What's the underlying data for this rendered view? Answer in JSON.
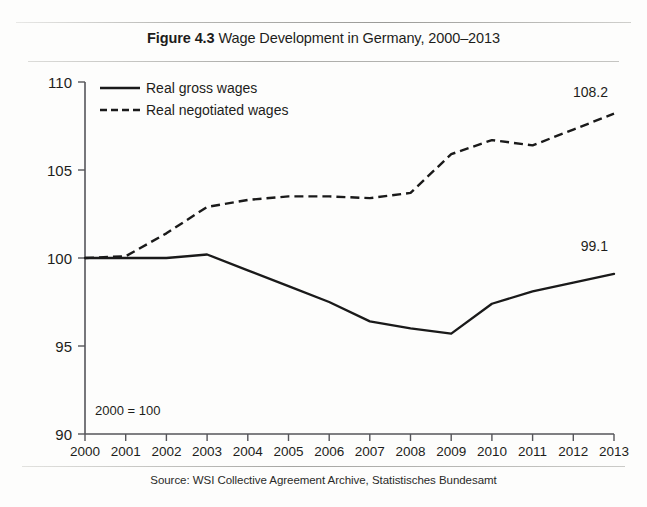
{
  "figure": {
    "number": "Figure 4.3",
    "caption": "Wage Development in Germany, 2000–2013",
    "source": "Source: WSI Collective Agreement Archive, Statistisches Bundesamt",
    "note": "2000 = 100"
  },
  "colors": {
    "ink": "#1a1a1a",
    "axis": "#55555a",
    "rule": "#a9a9a6",
    "background": "#fdfdfc"
  },
  "legend": {
    "position": "top-left-inside",
    "items": [
      {
        "label": "Real gross wages",
        "style": "solid"
      },
      {
        "label": "Real negotiated wages",
        "style": "dashed"
      }
    ]
  },
  "endpoint_labels": [
    {
      "series": "Real negotiated wages",
      "value": "108.2"
    },
    {
      "series": "Real gross wages",
      "value": "99.1"
    }
  ],
  "chart_data": {
    "type": "line",
    "title": "Figure 4.3 Wage Development in Germany, 2000–2013",
    "subtitle": "",
    "xlabel": "",
    "ylabel": "",
    "note": "2000 = 100",
    "source": "Source: WSI Collective Agreement Archive, Statistisches Bundesamt",
    "grid": false,
    "legend_position": "top-left-inside",
    "categories": [
      "2000",
      "2001",
      "2002",
      "2003",
      "2004",
      "2005",
      "2006",
      "2007",
      "2008",
      "2009",
      "2010",
      "2011",
      "2012",
      "2013"
    ],
    "x": [
      2000,
      2001,
      2002,
      2003,
      2004,
      2005,
      2006,
      2007,
      2008,
      2009,
      2010,
      2011,
      2012,
      2013
    ],
    "xlim": [
      2000,
      2013
    ],
    "ylim": [
      90,
      110
    ],
    "yticks": [
      90,
      95,
      100,
      105,
      110
    ],
    "xticks": [
      "2000",
      "2001",
      "2002",
      "2003",
      "2004",
      "2005",
      "2006",
      "2007",
      "2008",
      "2009",
      "2010",
      "2011",
      "2012",
      "2013"
    ],
    "series": [
      {
        "name": "Real gross wages",
        "style": "solid",
        "values": [
          100.0,
          100.0,
          100.0,
          100.2,
          99.3,
          98.4,
          97.5,
          96.4,
          96.0,
          95.7,
          97.4,
          98.1,
          98.6,
          99.1
        ]
      },
      {
        "name": "Real negotiated wages",
        "style": "dashed",
        "values": [
          100.0,
          100.1,
          101.4,
          102.9,
          103.3,
          103.5,
          103.5,
          103.4,
          103.7,
          105.9,
          106.7,
          106.4,
          107.3,
          108.2
        ]
      }
    ]
  }
}
